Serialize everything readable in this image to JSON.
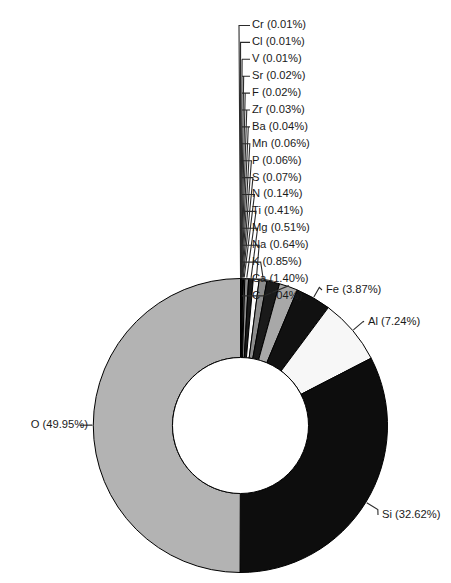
{
  "chart_data": {
    "type": "pie",
    "variant": "donut",
    "title": "",
    "subtitle": "",
    "xlabel": "",
    "ylabel": "",
    "units": "percent",
    "value_suffix": "%",
    "start_angle_deg": 0,
    "direction": "clockwise",
    "inner_radius_ratio": 0.462,
    "legend": "none (direct labels with leader lines)",
    "grid": false,
    "labels": [
      "Cr",
      "Cl",
      "V",
      "Sr",
      "F",
      "Zr",
      "Ba",
      "Mn",
      "P",
      "S",
      "N",
      "Ti",
      "Mg",
      "Na",
      "K",
      "Ca",
      "C",
      "Fe",
      "Al",
      "Si",
      "O"
    ],
    "values": [
      0.01,
      0.01,
      0.01,
      0.02,
      0.02,
      0.03,
      0.04,
      0.06,
      0.06,
      0.07,
      0.14,
      0.41,
      0.51,
      0.64,
      0.85,
      1.4,
      2.04,
      3.87,
      7.24,
      32.62,
      49.95
    ],
    "slices": [
      {
        "label": "Cr",
        "value": 0.01,
        "text": "Cr (0.01%)",
        "color": "#1a1a1a"
      },
      {
        "label": "Cl",
        "value": 0.01,
        "text": "Cl (0.01%)",
        "color": "#fafafa"
      },
      {
        "label": "V",
        "value": 0.01,
        "text": "V (0.01%)",
        "color": "#8c8c8c"
      },
      {
        "label": "Sr",
        "value": 0.02,
        "text": "Sr (0.02%)",
        "color": "#1a1a1a"
      },
      {
        "label": "F",
        "value": 0.02,
        "text": "F (0.02%)",
        "color": "#fafafa"
      },
      {
        "label": "Zr",
        "value": 0.03,
        "text": "Zr (0.03%)",
        "color": "#8c8c8c"
      },
      {
        "label": "Ba",
        "value": 0.04,
        "text": "Ba (0.04%)",
        "color": "#1a1a1a"
      },
      {
        "label": "Mn",
        "value": 0.06,
        "text": "Mn (0.06%)",
        "color": "#fafafa"
      },
      {
        "label": "P",
        "value": 0.06,
        "text": "P (0.06%)",
        "color": "#8c8c8c"
      },
      {
        "label": "S",
        "value": 0.07,
        "text": "S (0.07%)",
        "color": "#1a1a1a"
      },
      {
        "label": "N",
        "value": 0.14,
        "text": "N (0.14%)",
        "color": "#fafafa"
      },
      {
        "label": "Ti",
        "value": 0.41,
        "text": "Ti (0.41%)",
        "color": "#8c8c8c"
      },
      {
        "label": "Mg",
        "value": 0.51,
        "text": "Mg (0.51%)",
        "color": "#1a1a1a"
      },
      {
        "label": "Na",
        "value": 0.64,
        "text": "Na (0.64%)",
        "color": "#fafafa"
      },
      {
        "label": "K",
        "value": 0.85,
        "text": "K (0.85%)",
        "color": "#8c8c8c"
      },
      {
        "label": "Ca",
        "value": 1.4,
        "text": "Ca (1.40%)",
        "color": "#1a1a1a"
      },
      {
        "label": "C",
        "value": 2.04,
        "text": "C (2.04%)",
        "color": "#a8a8a8"
      },
      {
        "label": "Fe",
        "value": 3.87,
        "text": "Fe (3.87%)",
        "color": "#111111"
      },
      {
        "label": "Al",
        "value": 7.24,
        "text": "Al (7.24%)",
        "color": "#f7f7f7"
      },
      {
        "label": "Si",
        "value": 32.62,
        "text": "Si (32.62%)",
        "color": "#0d0d0d"
      },
      {
        "label": "O",
        "value": 49.95,
        "text": "O (49.95%)",
        "color": "#b3b3b3"
      }
    ],
    "stacked_label_list": [
      "Cr (0.01%)",
      "Cl (0.01%)",
      "V (0.01%)",
      "Sr (0.02%)",
      "F (0.02%)",
      "Zr (0.03%)",
      "Ba (0.04%)",
      "Mn (0.06%)",
      "P (0.06%)",
      "S (0.07%)",
      "N (0.14%)",
      "Ti (0.41%)",
      "Mg (0.51%)",
      "Na (0.64%)",
      "K (0.85%)",
      "Ca (1.40%)",
      "C (2.04%)"
    ],
    "outer_labels": [
      "Fe (3.87%)",
      "Al (7.24%)",
      "Si (32.62%)",
      "O (49.95%)"
    ],
    "total": 100.0
  },
  "palette": {
    "black": "#0d0d0d",
    "dark": "#1a1a1a",
    "gray": "#8c8c8c",
    "light_gray": "#b3b3b3",
    "white": "#fafafa",
    "stroke": "#000000",
    "leader": "#2b2b2b",
    "text": "#1a1a1a",
    "background": "#ffffff"
  }
}
